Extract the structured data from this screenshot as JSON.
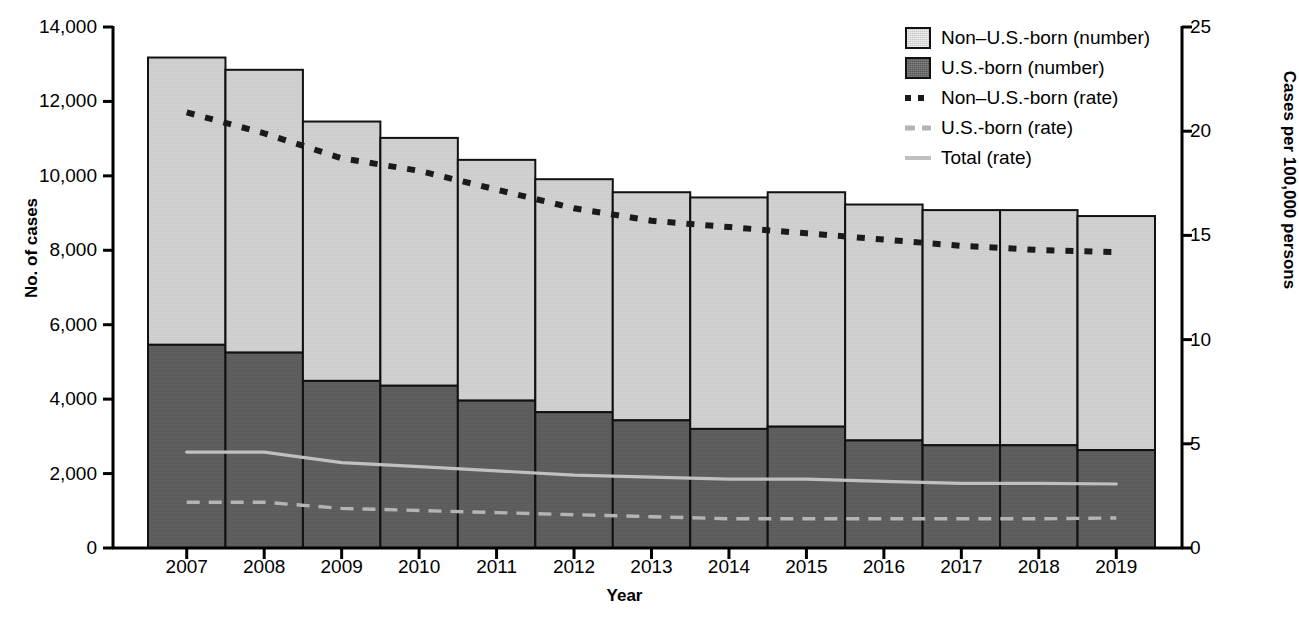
{
  "chart_data": {
    "type": "bar",
    "title": "",
    "subtitle": "",
    "xlabel": "Year",
    "ylabel": "No. of cases",
    "ylabel_right": "Cases per 100,000 persons",
    "categories": [
      "2007",
      "2008",
      "2009",
      "2010",
      "2011",
      "2012",
      "2013",
      "2014",
      "2015",
      "2016",
      "2017",
      "2018",
      "2019"
    ],
    "ylim": [
      0,
      14000
    ],
    "yticks": [
      0,
      2000,
      4000,
      6000,
      8000,
      10000,
      12000,
      14000
    ],
    "ytick_labels": [
      "0",
      "2,000",
      "4,000",
      "6,000",
      "8,000",
      "10,000",
      "12,000",
      "14,000"
    ],
    "ylim_right": [
      0,
      25
    ],
    "yticks_right": [
      0,
      5,
      10,
      15,
      20,
      25
    ],
    "ytick_labels_right": [
      "0",
      "5",
      "10",
      "15",
      "20",
      "25"
    ],
    "grid": false,
    "legend_position": "top-right",
    "series": [
      {
        "name": "U.S.-born (number)",
        "axis": "left",
        "kind": "bar-segment",
        "color": "#585858",
        "values": [
          5460,
          5250,
          4490,
          4360,
          3960,
          3650,
          3430,
          3200,
          3260,
          2890,
          2760,
          2760,
          2630
        ]
      },
      {
        "name": "Non–U.S.-born (number)",
        "axis": "left",
        "kind": "bar-segment",
        "color": "#c9c9c9",
        "values": [
          7720,
          7600,
          6970,
          6660,
          6470,
          6260,
          6130,
          6220,
          6300,
          6340,
          6320,
          6320,
          6290
        ]
      },
      {
        "name": "Total (number)",
        "axis": "left",
        "kind": "bar-total",
        "values": [
          13180,
          12850,
          11460,
          11020,
          10430,
          9910,
          9560,
          9420,
          9560,
          9230,
          9080,
          9080,
          8920
        ]
      },
      {
        "name": "Non–U.S.-born (rate)",
        "axis": "right",
        "kind": "line-dotted",
        "color": "#1a1a1a",
        "values": [
          20.9,
          19.9,
          18.7,
          18.1,
          17.2,
          16.3,
          15.7,
          15.4,
          15.1,
          14.8,
          14.5,
          14.3,
          14.2
        ]
      },
      {
        "name": "U.S.-born (rate)",
        "axis": "right",
        "kind": "line-dashed",
        "color": "#b4b4b4",
        "values": [
          2.2,
          2.2,
          1.9,
          1.8,
          1.7,
          1.6,
          1.5,
          1.4,
          1.4,
          1.4,
          1.4,
          1.4,
          1.44
        ]
      },
      {
        "name": "Total (rate)",
        "axis": "right",
        "kind": "line-solid",
        "color": "#c0c0c0",
        "values": [
          4.6,
          4.6,
          4.1,
          3.9,
          3.7,
          3.5,
          3.4,
          3.3,
          3.3,
          3.2,
          3.1,
          3.1,
          3.07
        ]
      }
    ]
  },
  "axes": {
    "left_title": "No. of cases",
    "right_title": "Cases per 100,000 persons",
    "x_title": "Year"
  },
  "legend": {
    "items": [
      {
        "label": "Non–U.S.-born (number)",
        "key": "swatch-light"
      },
      {
        "label": "U.S.-born (number)",
        "key": "swatch-dark"
      },
      {
        "label": "Non–U.S.-born (rate)",
        "key": "line-dotted"
      },
      {
        "label": "U.S.-born (rate)",
        "key": "line-dashed"
      },
      {
        "label": "Total (rate)",
        "key": "line-solid"
      }
    ]
  }
}
